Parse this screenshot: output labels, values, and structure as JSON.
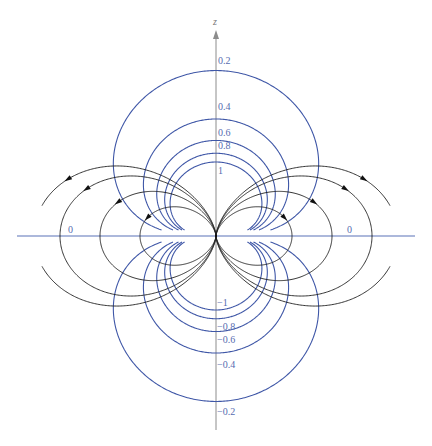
{
  "axes": {
    "z_label": "z",
    "origin": [
      216,
      236
    ],
    "z_axis": {
      "top": 30,
      "bottom": 430
    },
    "x_axis": {
      "left": 17,
      "right": 415
    },
    "z_label_pos": [
      213,
      25
    ]
  },
  "colors": {
    "equipotential": "#3f57a7",
    "field_line": "#1e1e1e",
    "arrow": "#111111",
    "x_axis": "#5b73b8",
    "z_axis": "#8c8c8c",
    "label": "#566cb0",
    "z_label": "#777777"
  },
  "equipotentials": {
    "scale": 74,
    "clip_z": 6,
    "values": [
      0.2,
      0.4,
      0.6,
      0.8,
      1,
      -0.2,
      -0.4,
      -0.6,
      -0.8,
      -1
    ]
  },
  "field_lines": {
    "clip_x": 174,
    "arrows_on": "upper-half",
    "lines": [
      {
        "C": 76,
        "arrow_deg": 75
      },
      {
        "C": 116,
        "arrow_deg": 71
      },
      {
        "C": 156,
        "arrow_deg": 70
      },
      {
        "C": 182,
        "arrow_deg": 69
      }
    ]
  },
  "labels": [
    {
      "text": "0.2",
      "x": 218,
      "y": 64
    },
    {
      "text": "0.4",
      "x": 218,
      "y": 110
    },
    {
      "text": "0.6",
      "x": 218,
      "y": 136
    },
    {
      "text": "0.8",
      "x": 218,
      "y": 149
    },
    {
      "text": "1",
      "x": 218,
      "y": 174
    },
    {
      "text": "0",
      "x": 68,
      "y": 233
    },
    {
      "text": "0",
      "x": 347,
      "y": 233
    },
    {
      "text": "−1",
      "x": 217,
      "y": 306
    },
    {
      "text": "−0.8",
      "x": 217,
      "y": 330
    },
    {
      "text": "−0.6",
      "x": 217,
      "y": 343
    },
    {
      "text": "−0.4",
      "x": 217,
      "y": 368
    },
    {
      "text": "−0.2",
      "x": 217,
      "y": 415
    }
  ]
}
